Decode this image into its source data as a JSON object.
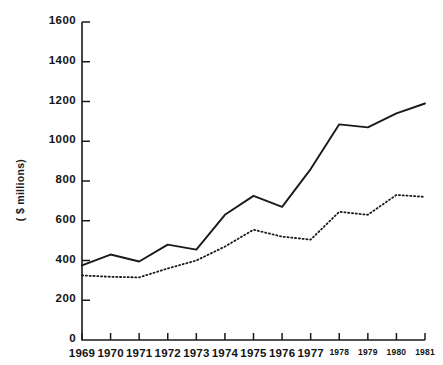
{
  "chart_data": {
    "type": "line",
    "title": "",
    "subtitle": "",
    "xlabel": "",
    "ylabel": "( $ millions)",
    "x": [
      1969,
      1970,
      1971,
      1972,
      1973,
      1974,
      1975,
      1976,
      1977,
      1978,
      1979,
      1980,
      1981
    ],
    "categories": [
      "1969",
      "1970",
      "1971",
      "1972",
      "1973",
      "1974",
      "1975",
      "1976",
      "1977",
      "1978",
      "1979",
      "1980",
      "1981"
    ],
    "xlim": [
      1969,
      1981
    ],
    "ylim": [
      0,
      1600
    ],
    "yticks": [
      0,
      200,
      400,
      600,
      800,
      1000,
      1200,
      1400,
      1600
    ],
    "ytick_labels": [
      "0",
      "200",
      "400",
      "600",
      "800",
      "1000",
      "1200",
      "1400",
      "1600"
    ],
    "grid": false,
    "legend": "none",
    "series": [
      {
        "name": "solid-series",
        "style": "solid",
        "color": "#1a1a1a",
        "values": [
          375,
          430,
          395,
          480,
          455,
          630,
          725,
          670,
          860,
          1085,
          1070,
          1140,
          1190
        ]
      },
      {
        "name": "dotted-series",
        "style": "dotted",
        "color": "#1a1a1a",
        "values": [
          325,
          318,
          315,
          360,
          400,
          470,
          555,
          520,
          505,
          645,
          630,
          730,
          720
        ]
      }
    ],
    "annotations": []
  },
  "axis": {
    "y_label_text": "( $ millions)",
    "zero_label": "0"
  },
  "ticks": {
    "y": [
      {
        "value": 1600,
        "label": "1600"
      },
      {
        "value": 1400,
        "label": "1400"
      },
      {
        "value": 1200,
        "label": "1200"
      },
      {
        "value": 1000,
        "label": "1000"
      },
      {
        "value": 800,
        "label": "800"
      },
      {
        "value": 600,
        "label": "600"
      },
      {
        "value": 400,
        "label": "400"
      },
      {
        "value": 200,
        "label": "200"
      },
      {
        "value": 0,
        "label": "0"
      }
    ],
    "x": [
      {
        "value": 1969,
        "label": "1969",
        "size": "big"
      },
      {
        "value": 1970,
        "label": "1970",
        "size": "big"
      },
      {
        "value": 1971,
        "label": "1971",
        "size": "big"
      },
      {
        "value": 1972,
        "label": "1972",
        "size": "big"
      },
      {
        "value": 1973,
        "label": "1973",
        "size": "big"
      },
      {
        "value": 1974,
        "label": "1974",
        "size": "big"
      },
      {
        "value": 1975,
        "label": "1975",
        "size": "big"
      },
      {
        "value": 1976,
        "label": "1976",
        "size": "big"
      },
      {
        "value": 1977,
        "label": "1977",
        "size": "big"
      },
      {
        "value": 1978,
        "label": "1978",
        "size": "small"
      },
      {
        "value": 1979,
        "label": "1979",
        "size": "small"
      },
      {
        "value": 1980,
        "label": "1980",
        "size": "small"
      },
      {
        "value": 1981,
        "label": "1981",
        "size": "small"
      }
    ]
  },
  "colors": {
    "axis": "#1a1a1a",
    "series_solid": "#1a1a1a",
    "series_dotted": "#1a1a1a",
    "background": "#ffffff"
  }
}
